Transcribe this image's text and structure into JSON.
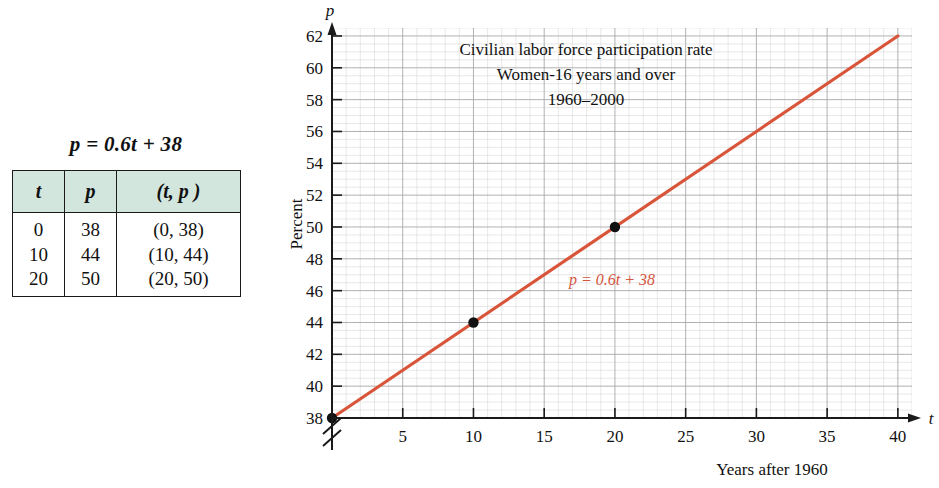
{
  "equation_caption": "p = 0.6t + 38",
  "table": {
    "headers": [
      "t",
      "p",
      "(t, p )"
    ],
    "rows": [
      [
        "0",
        "38",
        "(0, 38)"
      ],
      [
        "10",
        "44",
        "(10, 44)"
      ],
      [
        "20",
        "50",
        "(20, 50)"
      ]
    ],
    "header_bg": "#d2e6de"
  },
  "chart_data": {
    "type": "line",
    "title": "Civilian labor force participation rate",
    "subtitle": "Women-16 years and over",
    "subtitle2": "1960–2000",
    "xlabel": "Years after 1960",
    "ylabel": "Percent",
    "x_axis_symbol": "t",
    "y_axis_symbol": "p",
    "xlim": [
      0,
      41
    ],
    "ylim": [
      38,
      62.5
    ],
    "xticks": [
      5,
      10,
      15,
      20,
      25,
      30,
      35,
      40
    ],
    "xtick_labels": [
      "5",
      "10",
      "15",
      "20",
      "25",
      "30",
      "35",
      "40"
    ],
    "yticks": [
      38,
      40,
      42,
      44,
      46,
      48,
      50,
      52,
      54,
      56,
      58,
      60,
      62
    ],
    "ytick_labels": [
      "38",
      "40",
      "42",
      "44",
      "46",
      "48",
      "50",
      "52",
      "54",
      "56",
      "58",
      "60",
      "62"
    ],
    "grid": true,
    "axis_break": "y-axis break below 38",
    "line_color": "#d9553a",
    "line_annotation": "p = 0.6t + 38",
    "series": [
      {
        "name": "p = 0.6t + 38",
        "x": [
          0,
          40
        ],
        "values": [
          38,
          62
        ]
      }
    ],
    "points": [
      {
        "x": 0,
        "y": 38,
        "label": "(0, 38)"
      },
      {
        "x": 10,
        "y": 44,
        "label": "(10, 44)"
      },
      {
        "x": 20,
        "y": 50,
        "label": "(20, 50)"
      }
    ]
  }
}
